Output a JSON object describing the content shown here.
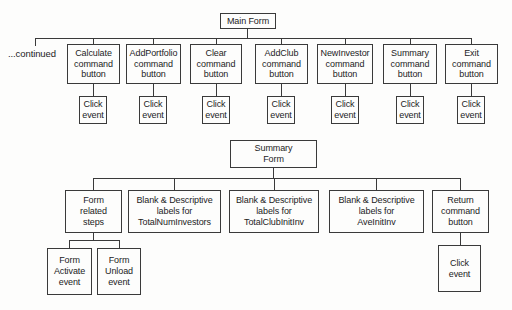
{
  "diagram": {
    "continued_label": "...continued",
    "main_form": {
      "label": "Main Form"
    },
    "main_children": [
      {
        "label": "Calculate\ncommand\nbutton",
        "event": "Click\nevent"
      },
      {
        "label": "AddPortfolio\ncommand\nbutton",
        "event": "Click\nevent"
      },
      {
        "label": "Clear\ncommand\nbutton",
        "event": "Click\nevent"
      },
      {
        "label": "AddClub\ncommand\nbutton",
        "event": "Click\nevent"
      },
      {
        "label": "NewInvestor\ncommand\nbutton",
        "event": "Click\nevent"
      },
      {
        "label": "Summary\ncommand\nbutton",
        "event": "Click\nevent"
      },
      {
        "label": "Exit\ncommand\nbutton",
        "event": "Click\nevent"
      }
    ],
    "summary_form": {
      "label": "Summary\nForm"
    },
    "summary_children": [
      {
        "label": "Form\nrelated\nsteps"
      },
      {
        "label": "Blank & Descriptive\nlabels for\nTotalNumInvestors"
      },
      {
        "label": "Blank & Descriptive\nlabels for\nTotalClubInitInv"
      },
      {
        "label": "Blank & Descriptive\nlabels for\nAveInitInv"
      },
      {
        "label": "Return\ncommand\nbutton"
      }
    ],
    "form_related_events": [
      {
        "label": "Form\nActivate\nevent"
      },
      {
        "label": "Form\nUnload\nevent"
      }
    ],
    "return_event": {
      "label": "Click\nevent"
    },
    "colors": {
      "line": "#3a3a3a",
      "text": "#1c1c1c",
      "background": "#fdfdfc"
    }
  }
}
